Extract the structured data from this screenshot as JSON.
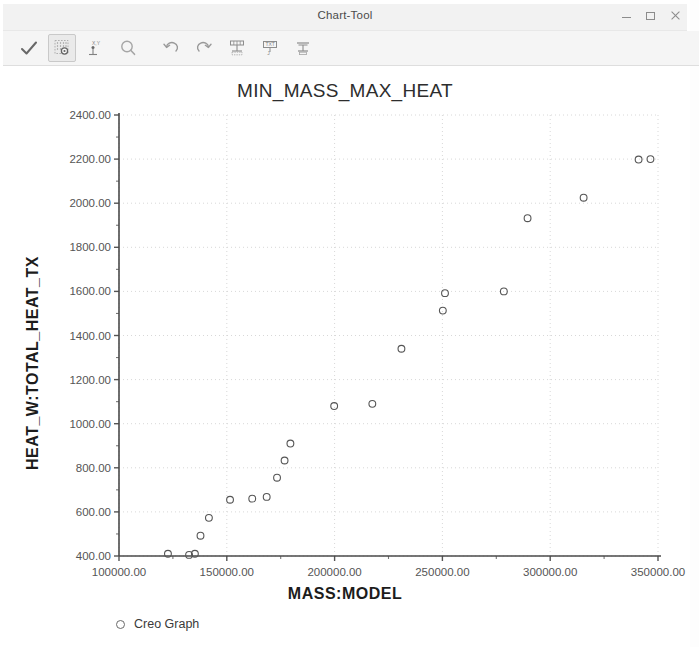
{
  "window": {
    "title": "Chart-Tool",
    "controls": [
      {
        "name": "minimize-button",
        "glyph": "minimize"
      },
      {
        "name": "maximize-button",
        "glyph": "maximize"
      },
      {
        "name": "close-button",
        "glyph": "close"
      }
    ]
  },
  "toolbar": {
    "buttons": [
      {
        "name": "accept-check-icon",
        "tooltip": "Accept",
        "selected": false
      },
      {
        "name": "grid-points-icon",
        "tooltip": "Show Data Points",
        "selected": true
      },
      {
        "name": "xy-axis-icon",
        "tooltip": "X,Y Axis",
        "selected": false
      },
      {
        "name": "zoom-icon",
        "tooltip": "Zoom",
        "selected": false
      },
      {
        "name": "undo-icon",
        "tooltip": "Undo",
        "selected": false
      },
      {
        "name": "redo-icon",
        "tooltip": "Redo",
        "selected": false
      },
      {
        "name": "table-icon",
        "tooltip": "Table View",
        "selected": false
      },
      {
        "name": "text-format-icon",
        "tooltip": "Format Text",
        "selected": false
      },
      {
        "name": "export-icon",
        "tooltip": "Export",
        "selected": false
      }
    ]
  },
  "chart_data": {
    "type": "scatter",
    "title": "MIN_MASS_MAX_HEAT",
    "xlabel": "MASS:MODEL",
    "ylabel": "HEAT_W:TOTAL_HEAT_TX",
    "xlim": [
      100000,
      350000
    ],
    "ylim": [
      400,
      2400
    ],
    "xticks": [
      100000,
      150000,
      200000,
      250000,
      300000,
      350000
    ],
    "xtick_labels": [
      "100000.00",
      "150000.00",
      "200000.00",
      "250000.00",
      "300000.00",
      "350000.00"
    ],
    "yticks": [
      400,
      600,
      800,
      1000,
      1200,
      1400,
      1600,
      1800,
      2000,
      2200,
      2400
    ],
    "ytick_labels": [
      "400.00",
      "600.00",
      "800.00",
      "1000.00",
      "1200.00",
      "1400.00",
      "1600.00",
      "1800.00",
      "2000.00",
      "2200.00",
      "2400.00"
    ],
    "minor_ticks_y": 1,
    "grid": true,
    "grid_style": "dotted",
    "marker": "open-circle",
    "marker_color": "#555555",
    "legend": {
      "position": "bottom-left",
      "entries": [
        "Creo Graph"
      ]
    },
    "series": [
      {
        "name": "Creo Graph",
        "points": [
          [
            122700,
            410
          ],
          [
            132500,
            405
          ],
          [
            135200,
            410
          ],
          [
            137800,
            492
          ],
          [
            141700,
            573
          ],
          [
            151500,
            655
          ],
          [
            161800,
            660
          ],
          [
            168500,
            668
          ],
          [
            173300,
            755
          ],
          [
            176800,
            833
          ],
          [
            179500,
            910
          ],
          [
            199800,
            1080
          ],
          [
            217500,
            1090
          ],
          [
            231000,
            1340
          ],
          [
            250200,
            1513
          ],
          [
            251200,
            1592
          ],
          [
            278500,
            1600
          ],
          [
            289500,
            1932
          ],
          [
            315500,
            2025
          ],
          [
            341000,
            2198
          ],
          [
            346500,
            2200
          ]
        ]
      }
    ]
  }
}
